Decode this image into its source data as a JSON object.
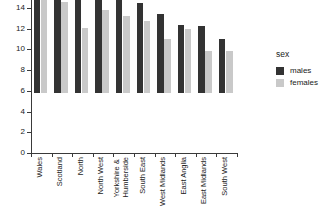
{
  "chart_data": {
    "type": "bar",
    "title": "",
    "xlabel": "",
    "ylabel": "",
    "ylim": [
      0,
      15.6
    ],
    "yticks": [
      0,
      2,
      4,
      6,
      8,
      10,
      12,
      14
    ],
    "grid": false,
    "legend": {
      "title": "sex",
      "position": "right",
      "entries": [
        {
          "name": "males",
          "color": "#333333"
        },
        {
          "name": "females",
          "color": "#c9c9c9"
        }
      ]
    },
    "categories": [
      "Wales",
      "Scotland",
      "North",
      "North West",
      "Yorkshire & Humberside",
      "South East",
      "West Midlands",
      "East Anglia",
      "East Midlands",
      "South West"
    ],
    "series": [
      {
        "name": "males",
        "color": "#333333",
        "values": [
          15.5,
          11.6,
          11.5,
          9.8,
          9.4,
          8.7,
          7.6,
          6.6,
          6.5,
          5.2
        ]
      },
      {
        "name": "females",
        "color": "#c9c9c9",
        "values": [
          10.2,
          8.8,
          6.3,
          8.0,
          7.4,
          7.0,
          5.2,
          6.2,
          4.1,
          4.1
        ]
      }
    ]
  },
  "axis": {
    "y_tick_labels": [
      "0",
      "2",
      "4",
      "6",
      "8",
      "10",
      "12",
      "14"
    ]
  },
  "colors": {
    "male": "#333333",
    "female": "#c9c9c9",
    "axis": "#3a3a3a",
    "text": "#1a1a1a",
    "background": "#ffffff"
  }
}
